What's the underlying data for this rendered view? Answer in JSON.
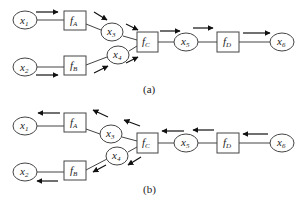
{
  "panels": [
    {
      "id": "a",
      "caption": "(a)",
      "direction": "forward",
      "variables": [
        {
          "id": "x1",
          "base": "x",
          "sub": "1"
        },
        {
          "id": "x2",
          "base": "x",
          "sub": "2"
        },
        {
          "id": "x3",
          "base": "x",
          "sub": "3"
        },
        {
          "id": "x4",
          "base": "x",
          "sub": "4"
        },
        {
          "id": "x5",
          "base": "x",
          "sub": "5"
        },
        {
          "id": "x6",
          "base": "x",
          "sub": "6"
        }
      ],
      "functions": [
        {
          "id": "fA",
          "base": "f",
          "sub": "A"
        },
        {
          "id": "fB",
          "base": "f",
          "sub": "B"
        },
        {
          "id": "fC",
          "base": "f",
          "sub": "C"
        },
        {
          "id": "fD",
          "base": "f",
          "sub": "D"
        }
      ]
    },
    {
      "id": "b",
      "caption": "(b)",
      "direction": "backward",
      "variables": [
        {
          "id": "x1",
          "base": "x",
          "sub": "1"
        },
        {
          "id": "x2",
          "base": "x",
          "sub": "2"
        },
        {
          "id": "x3",
          "base": "x",
          "sub": "3"
        },
        {
          "id": "x4",
          "base": "x",
          "sub": "4"
        },
        {
          "id": "x5",
          "base": "x",
          "sub": "5"
        },
        {
          "id": "x6",
          "base": "x",
          "sub": "6"
        }
      ],
      "functions": [
        {
          "id": "fA",
          "base": "f",
          "sub": "A"
        },
        {
          "id": "fB",
          "base": "f",
          "sub": "B"
        },
        {
          "id": "fC",
          "base": "f",
          "sub": "C"
        },
        {
          "id": "fD",
          "base": "f",
          "sub": "D"
        }
      ]
    }
  ],
  "edges": [
    [
      "x1",
      "fA"
    ],
    [
      "fA",
      "x3"
    ],
    [
      "x3",
      "fC"
    ],
    [
      "x2",
      "fB"
    ],
    [
      "fB",
      "x4"
    ],
    [
      "x4",
      "fC"
    ],
    [
      "fC",
      "x5"
    ],
    [
      "x5",
      "fD"
    ],
    [
      "fD",
      "x6"
    ]
  ],
  "colors": {
    "stroke": "#444444",
    "arrow": "#111111",
    "background": "#ffffff"
  }
}
